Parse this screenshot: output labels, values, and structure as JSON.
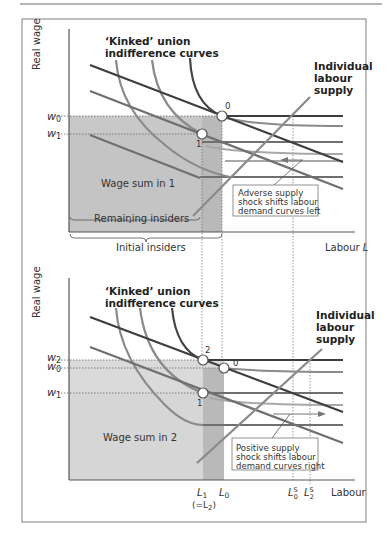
{
  "colors": {
    "frame": "#9a9a9a",
    "top_rule": "#6e6e6e",
    "shade_light": "#dcdcdc",
    "shade_mid": "#cfcfcf",
    "shade_dark": "#b7b7b7",
    "demand_dark": "#3d3d3d",
    "demand_mid": "#6f6f6f",
    "curve_gray": "#8a8a8a",
    "curve_light": "#a8a8a8",
    "curve_dark": "#444444"
  },
  "top_panel": {
    "y_axis_label": "Real wage",
    "x_axis_label": "Labour",
    "x_axis_symbol": "L",
    "curves_title_line1": "‘Kinked’ union",
    "curves_title_line2": "indifference curves",
    "supply_label_line1": "Individual",
    "supply_label_line2": "labour",
    "supply_label_line3": "supply",
    "w0": "w",
    "w0_sub": "0",
    "w1": "w",
    "w1_sub": "1",
    "point_0": "0",
    "point_1": "1",
    "wage_sum": "Wage sum in 1",
    "remaining_insiders": "Remaining insiders",
    "initial_insiders": "Initial insiders",
    "annotation_line1": "Adverse supply",
    "annotation_line2": "shock shifts labour",
    "annotation_line3": "demand curves left"
  },
  "bottom_panel": {
    "y_axis_label": "Real wage",
    "x_axis_label": "Labour",
    "curves_title_line1": "‘Kinked’ union",
    "curves_title_line2": "indifference curves",
    "supply_label_line1": "Individual",
    "supply_label_line2": "labour",
    "supply_label_line3": "supply",
    "w2": "w",
    "w2_sub": "2",
    "w0": "w",
    "w0_sub": "0",
    "w1": "w",
    "w1_sub": "1",
    "point_2": "2",
    "point_0": "0",
    "point_1": "1",
    "wage_sum": "Wage sum in 2",
    "L1": "L",
    "L1_sub": "1",
    "L1_note": "(=L",
    "L1_note_sub": "2",
    "L1_note_close": ")",
    "L0": "L",
    "L0_sub": "0",
    "L0S": "L",
    "L0S_sup": "S",
    "L0S_sub": "0",
    "L2S": "L",
    "L2S_sup": "S",
    "L2S_sub": "2",
    "annotation_line1": "Positive supply",
    "annotation_line2": "shock shifts labour",
    "annotation_line3": "demand curves right"
  }
}
